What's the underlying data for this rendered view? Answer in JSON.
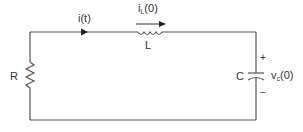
{
  "diagram": {
    "type": "series RLC circuit",
    "colors": {
      "wire": "#555555",
      "text": "#333333",
      "background": "#ffffff"
    },
    "labels": {
      "current": "i(t)",
      "inductor_current_main": "i",
      "inductor_current_sub": "L",
      "inductor_current_tail": "(0)",
      "inductor": "L",
      "resistor": "R",
      "capacitor": "C",
      "cap_voltage_main": "v",
      "cap_voltage_sub": "c",
      "cap_voltage_tail": "(0)",
      "plus": "+",
      "minus": "−"
    },
    "components": [
      {
        "name": "resistor",
        "label": "R",
        "position": "left branch"
      },
      {
        "name": "inductor",
        "label": "L",
        "position": "top branch",
        "initial_current": "iL(0)"
      },
      {
        "name": "capacitor",
        "label": "C",
        "position": "right branch",
        "initial_voltage": "vc(0)"
      }
    ]
  }
}
